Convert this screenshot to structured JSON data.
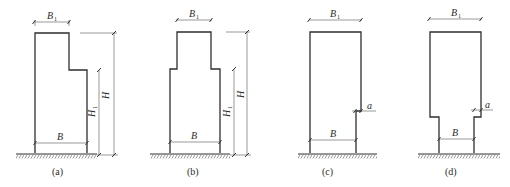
{
  "figure": {
    "type": "engineering-section-diagram",
    "colors": {
      "line": "#2e2e2e",
      "dimension": "#555555",
      "background": "#ffffff"
    },
    "panels": [
      {
        "id": "a",
        "caption": "(a)",
        "dims": {
          "top_width": "B",
          "top_width_sub": "1",
          "base_width": "B",
          "height": "H",
          "step_height": "H",
          "step_height_sub": "1"
        },
        "shape": "single-sided-step"
      },
      {
        "id": "b",
        "caption": "(b)",
        "dims": {
          "top_width": "B",
          "top_width_sub": "1",
          "base_width": "B",
          "height": "H",
          "step_height": "H",
          "step_height_sub": "1"
        },
        "shape": "double-sided-step"
      },
      {
        "id": "c",
        "caption": "(c)",
        "dims": {
          "top_width": "B",
          "top_width_sub": "1",
          "base_width": "B",
          "offset": "a"
        },
        "shape": "single-sided-notch"
      },
      {
        "id": "d",
        "caption": "(d)",
        "dims": {
          "top_width": "B",
          "top_width_sub": "1",
          "base_width": "B",
          "offset": "a"
        },
        "shape": "double-sided-notch"
      }
    ]
  }
}
